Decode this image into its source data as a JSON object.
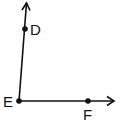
{
  "diagram": {
    "colors": {
      "stroke": "#111111",
      "background": "#ffffff"
    },
    "points": [
      {
        "name": "D",
        "label": "D",
        "x": 25,
        "y": 29
      },
      {
        "name": "E",
        "label": "E",
        "x": 19,
        "y": 101
      },
      {
        "name": "F",
        "label": "F",
        "x": 88,
        "y": 101
      }
    ],
    "rays": [
      {
        "name": "ray-ED",
        "from": "E",
        "through": "D",
        "arrow": true
      },
      {
        "name": "ray-EF",
        "from": "E",
        "through": "F",
        "arrow": true
      }
    ],
    "labels": {
      "d": "D",
      "e": "E",
      "f": "F"
    }
  }
}
